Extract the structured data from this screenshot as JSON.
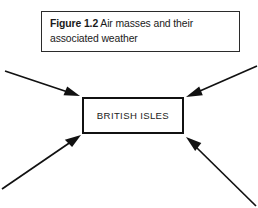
{
  "figure": {
    "caption": {
      "label": "Figure 1.2",
      "body": "  Air masses and their associated weather"
    },
    "center": {
      "label": "BRITISH ISLES"
    },
    "colors": {
      "background": "#ffffff",
      "stroke": "#111111",
      "caption_border": "#2b2b2b",
      "text": "#1a1a1a"
    },
    "arrows": [
      {
        "name": "arrow-from-top-left",
        "direction": "down-right",
        "from": [
          5,
          71
        ],
        "to": [
          80,
          96
        ]
      },
      {
        "name": "arrow-from-top-right",
        "direction": "down-left",
        "from": [
          257,
          66
        ],
        "to": [
          186,
          97
        ]
      },
      {
        "name": "arrow-from-bottom-left",
        "direction": "up-right",
        "from": [
          2,
          189
        ],
        "to": [
          81,
          135
        ]
      },
      {
        "name": "arrow-from-bottom-right",
        "direction": "up-left",
        "from": [
          256,
          206
        ],
        "to": [
          186,
          137
        ]
      }
    ]
  }
}
